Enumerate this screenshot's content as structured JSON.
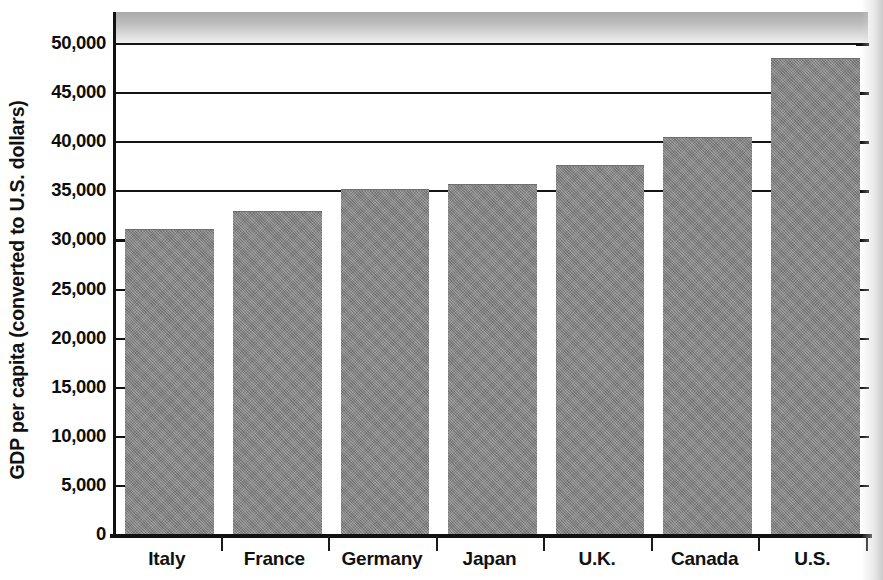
{
  "chart_data": {
    "type": "bar",
    "title": "",
    "xlabel": "",
    "ylabel": "GDP per capita (converted to U.S. dollars)",
    "categories": [
      "Italy",
      "France",
      "Germany",
      "Japan",
      "U.K.",
      "Canada",
      "U.S."
    ],
    "values": [
      31000,
      32800,
      35000,
      35500,
      37500,
      40300,
      48400
    ],
    "ylim": [
      0,
      52000
    ],
    "ytick_values": [
      0,
      5000,
      10000,
      15000,
      20000,
      25000,
      30000,
      35000,
      40000,
      45000,
      50000
    ],
    "ytick_labels": [
      "0",
      "5,000",
      "10,000",
      "15,000",
      "20,000",
      "25,000",
      "30,000",
      "35,000",
      "40,000",
      "45,000",
      "50,000"
    ],
    "gridline_values": [
      35000,
      40000,
      45000,
      50000
    ],
    "grid": true,
    "legend": "none",
    "bar_color": "#8a8a8a",
    "axis_color": "#111111"
  }
}
